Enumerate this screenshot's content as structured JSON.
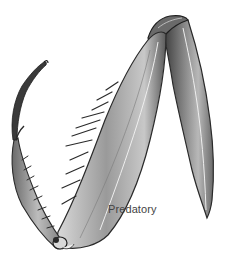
{
  "figure": {
    "label": "Predatory",
    "colors": {
      "background": "#ffffff",
      "ink_dark": "#2a2a2a",
      "ink_mid": "#8a8a8a",
      "ink_light": "#d0d0d0",
      "label_text": "#444444"
    }
  }
}
